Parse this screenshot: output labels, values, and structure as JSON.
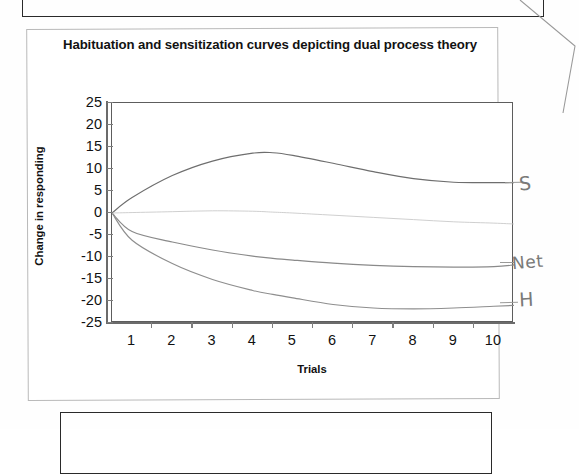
{
  "chart_title": "Habituation and sensitization curves depicting dual process theory",
  "axis": {
    "y_title": "Change in responding",
    "x_title": "Trials",
    "y_ticks": [
      "25",
      "20",
      "15",
      "10",
      "5",
      "0",
      "-5",
      "-10",
      "-15",
      "-20",
      "-25"
    ],
    "x_ticks": [
      "1",
      "2",
      "3",
      "4",
      "5",
      "6",
      "7",
      "8",
      "9",
      "10"
    ]
  },
  "annotations": {
    "sensitization": "S",
    "net": "Net",
    "habituation": "H"
  },
  "chart_data": {
    "type": "line",
    "title": "Habituation and sensitization curves depicting dual process theory",
    "xlabel": "Trials",
    "ylabel": "Change in responding",
    "xlim": [
      0.5,
      10.5
    ],
    "ylim": [
      -25,
      25
    ],
    "ytick_step": 5,
    "grid": false,
    "legend": "right-margin handwritten labels",
    "x": [
      0.5,
      1,
      2,
      3,
      4,
      4.5,
      5,
      6,
      7,
      8,
      9,
      10,
      10.5
    ],
    "series": [
      {
        "name": "S",
        "label": "Sensitization",
        "color": "#6e6e6e",
        "values": [
          0,
          3.5,
          8.5,
          11.8,
          13.6,
          13.7,
          13.1,
          11.3,
          9.4,
          7.8,
          7.0,
          6.9,
          6.9
        ]
      },
      {
        "name": "Net",
        "label": "Net responding",
        "color": "#8a8a8a",
        "values": [
          0,
          -4.2,
          -6.6,
          -8.4,
          -9.8,
          -10.3,
          -10.7,
          -11.4,
          -11.9,
          -12.2,
          -12.3,
          -12.2,
          -11.8
        ]
      },
      {
        "name": "H",
        "label": "Habituation",
        "color": "#8e8e8e",
        "values": [
          0,
          -6.2,
          -11.5,
          -15.1,
          -17.6,
          -18.5,
          -19.3,
          -20.8,
          -21.6,
          -21.8,
          -21.6,
          -21.2,
          -21.0
        ]
      },
      {
        "name": "baseline",
        "label": "Baseline / zero drift",
        "color": "#c9c9c9",
        "values": [
          0,
          0.1,
          0.3,
          0.5,
          0.4,
          0.2,
          0.0,
          -0.5,
          -1.0,
          -1.5,
          -2.0,
          -2.3,
          -2.5
        ]
      }
    ]
  }
}
